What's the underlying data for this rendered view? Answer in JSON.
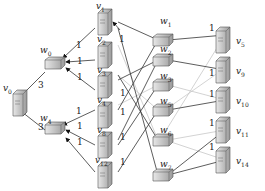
{
  "diagram": {
    "type": "network-topology",
    "nodes": {
      "source": {
        "id": "v0",
        "label": "v",
        "sub": "0",
        "kind": "server"
      },
      "relays": [
        {
          "id": "w0",
          "label": "w",
          "sub": "0",
          "kind": "router"
        },
        {
          "id": "w4",
          "label": "w",
          "sub": "4",
          "kind": "router"
        }
      ],
      "middle_servers": [
        {
          "id": "v1",
          "label": "v",
          "sub": "1"
        },
        {
          "id": "v2",
          "label": "v",
          "sub": "2"
        },
        {
          "id": "v3",
          "label": "v",
          "sub": "3"
        },
        {
          "id": "v4",
          "label": "v",
          "sub": "4"
        },
        {
          "id": "v8",
          "label": "v",
          "sub": "8"
        },
        {
          "id": "v12",
          "label": "v",
          "sub": "12"
        }
      ],
      "right_routers": [
        {
          "id": "w1",
          "label": "w",
          "sub": "1"
        },
        {
          "id": "w2",
          "label": "w",
          "sub": "2"
        },
        {
          "id": "w3",
          "label": "w",
          "sub": "3"
        },
        {
          "id": "w5",
          "label": "w",
          "sub": "5"
        },
        {
          "id": "w6",
          "label": "w",
          "sub": "6"
        },
        {
          "id": "w7",
          "label": "w",
          "sub": "7"
        }
      ],
      "right_servers": [
        {
          "id": "v5",
          "label": "v",
          "sub": "5"
        },
        {
          "id": "v9",
          "label": "v",
          "sub": "9"
        },
        {
          "id": "v10",
          "label": "v",
          "sub": "10"
        },
        {
          "id": "v11",
          "label": "v",
          "sub": "11"
        },
        {
          "id": "v14",
          "label": "v",
          "sub": "14"
        }
      ]
    },
    "edge_weights": {
      "w0_v0": "3",
      "w4_v0": "3",
      "v_to_w": "1"
    },
    "colors": {
      "edge_dark": "#333333",
      "edge_light": "#c8c8c8",
      "node_fill": "#cfcfcf",
      "node_dark": "#8a8a8a"
    }
  }
}
